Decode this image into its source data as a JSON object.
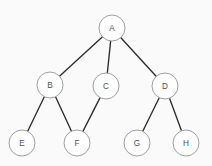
{
  "diagram": {
    "background_color": "#fafafa",
    "node_fill_color": "#ffffff",
    "node_stroke_color": "#9fa0a2",
    "edge_color": "#2d2d2d",
    "label_color": "#4e4e50",
    "node_radius": 13,
    "nodes": [
      {
        "id": "A",
        "label": "A",
        "x": 112,
        "y": 28,
        "level": 0
      },
      {
        "id": "B",
        "label": "B",
        "x": 50,
        "y": 85,
        "level": 1
      },
      {
        "id": "C",
        "label": "C",
        "x": 106,
        "y": 86,
        "level": 1
      },
      {
        "id": "D",
        "label": "D",
        "x": 165,
        "y": 86,
        "level": 1
      },
      {
        "id": "E",
        "label": "E",
        "x": 22,
        "y": 143,
        "level": 2
      },
      {
        "id": "F",
        "label": "F",
        "x": 77,
        "y": 143,
        "level": 2
      },
      {
        "id": "G",
        "label": "G",
        "x": 137,
        "y": 143,
        "level": 2
      },
      {
        "id": "H",
        "label": "H",
        "x": 186,
        "y": 143,
        "level": 2
      }
    ],
    "edges": [
      {
        "from": "A",
        "to": "B"
      },
      {
        "from": "A",
        "to": "C"
      },
      {
        "from": "A",
        "to": "D"
      },
      {
        "from": "B",
        "to": "E"
      },
      {
        "from": "B",
        "to": "F"
      },
      {
        "from": "C",
        "to": "F"
      },
      {
        "from": "D",
        "to": "G"
      },
      {
        "from": "D",
        "to": "H"
      }
    ]
  }
}
